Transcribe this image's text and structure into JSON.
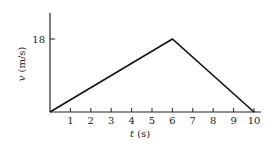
{
  "chart_data": {
    "type": "line",
    "title": "",
    "xlabel": "t (s)",
    "ylabel": "v (m/s)",
    "x": [
      0,
      6,
      10
    ],
    "series": [
      {
        "name": "velocity",
        "values": [
          0,
          18,
          0
        ]
      }
    ],
    "x_ticks": [
      "1",
      "2",
      "3",
      "4",
      "5",
      "6",
      "7",
      "8",
      "9",
      "10"
    ],
    "y_ticks": [
      "18"
    ],
    "xlim": [
      0,
      10.3
    ],
    "ylim": [
      0,
      25
    ],
    "grid": false,
    "legend": "none"
  },
  "labels": {
    "ylabel_var": "v",
    "ylabel_unit": " (m/s)",
    "xlabel_var": "t",
    "xlabel_unit": " (s)",
    "y18": "18",
    "x1": "1",
    "x2": "2",
    "x3": "3",
    "x4": "4",
    "x5": "5",
    "x6": "6",
    "x7": "7",
    "x8": "8",
    "x9": "9",
    "x10": "10"
  },
  "colors": {
    "line": "#111111",
    "axis": "#222222"
  }
}
